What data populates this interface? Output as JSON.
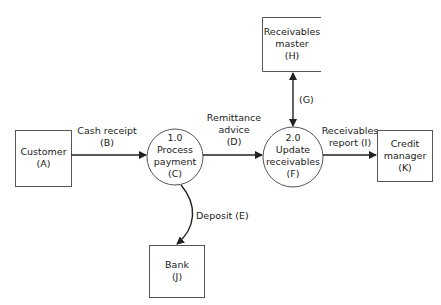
{
  "diagram": {
    "type": "data-flow-diagram",
    "entities": [
      {
        "id": "customer",
        "line1": "Customer",
        "line2": "(A)"
      },
      {
        "id": "bank",
        "line1": "Bank",
        "line2": "(J)"
      },
      {
        "id": "credit-manager",
        "line1": "Credit",
        "line2": "manager",
        "line3": "(K)"
      }
    ],
    "processes": [
      {
        "id": "process-payment",
        "number": "1.0",
        "line1": "Process",
        "line2": "payment",
        "line3": "(C)"
      },
      {
        "id": "update-receivables",
        "number": "2.0",
        "line1": "Update",
        "line2": "receivables",
        "line3": "(F)"
      }
    ],
    "data_store": {
      "id": "receivables-master",
      "line1": "Receivables",
      "line2": "master",
      "line3": "(H)"
    },
    "flows": [
      {
        "id": "cash-receipt",
        "line1": "Cash receipt",
        "line2": "(B)"
      },
      {
        "id": "remittance-advice",
        "line1": "Remittance",
        "line2": "advice",
        "line3": "(D)"
      },
      {
        "id": "deposit",
        "line1": "Deposit (E)"
      },
      {
        "id": "store-link",
        "line1": "(G)"
      },
      {
        "id": "receivables-report",
        "line1": "Receivables",
        "line2": "report (I)"
      }
    ],
    "colors": {
      "stroke": "#333333",
      "background": "#ffffff"
    }
  }
}
